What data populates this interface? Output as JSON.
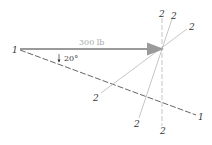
{
  "diagram": {
    "force": {
      "label": "300 lb",
      "color": "#9a9a9a",
      "from": [
        20,
        49
      ],
      "to": [
        162,
        49
      ]
    },
    "angle": {
      "label": "20°",
      "value_deg": 20
    },
    "axis_1_1": {
      "start_label": "1",
      "end_label": "1",
      "from": [
        20,
        50
      ],
      "to": [
        196,
        115
      ]
    },
    "axes_2_2": [
      {
        "name": "vertical",
        "top_label": "2",
        "bottom_label": "2"
      },
      {
        "name": "steep",
        "top_label": "2",
        "bottom_label": "2"
      },
      {
        "name": "shallow",
        "top_label": "2",
        "bottom_label": "2"
      }
    ],
    "pivot": [
      162,
      49
    ],
    "line_color": "#555555",
    "faint_color": "#b8b8b8"
  }
}
